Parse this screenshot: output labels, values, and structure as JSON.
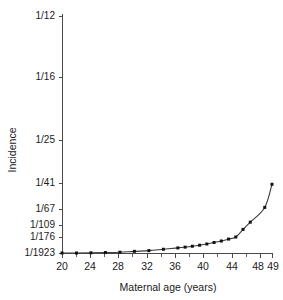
{
  "chart_data": {
    "type": "line",
    "title": "",
    "xlabel": "Maternal age (years)",
    "ylabel": "Incidence",
    "grid": false,
    "legend": null,
    "xlim": [
      20,
      49
    ],
    "x_tick_labels": [
      "20",
      "24",
      "28",
      "32",
      "36",
      "40",
      "44",
      "48",
      "49"
    ],
    "x_ticks": [
      20,
      24,
      28,
      32,
      36,
      40,
      44,
      48,
      49
    ],
    "x_minor_ticks": [
      22,
      26,
      30,
      34,
      38,
      42,
      46
    ],
    "y_tick_labels": [
      "1/12",
      "1/16",
      "1/25",
      "1/41",
      "1/67",
      "1/109",
      "1/176",
      "1/1923"
    ],
    "y_tick_values": [
      12,
      16,
      25,
      41,
      67,
      109,
      176,
      1923
    ],
    "y_axis_note": "Incidence expressed as 1 in N; axis is non-linear (reciprocal/log spaced)",
    "series": [
      {
        "name": "Incidence of Down syndrome",
        "x": [
          20,
          22,
          24,
          26,
          28,
          30,
          32,
          34,
          36,
          37,
          38,
          39,
          40,
          41,
          42,
          43,
          44,
          45,
          46,
          48,
          49
        ],
        "y_denominators": [
          1923,
          1923,
          1870,
          1800,
          1700,
          1500,
          1350,
          1100,
          900,
          800,
          700,
          600,
          500,
          400,
          320,
          240,
          176,
          130,
          100,
          65,
          42
        ],
        "y_labels": [
          "1/1923",
          "1/1923",
          "1/1870",
          "1/1800",
          "1/1700",
          "1/1500",
          "1/1350",
          "1/1100",
          "1/900",
          "1/800",
          "1/700",
          "1/600",
          "1/500",
          "1/400",
          "1/320",
          "1/240",
          "1/176",
          "1/130",
          "1/100",
          "1/65",
          "1/42"
        ]
      }
    ]
  },
  "axes": {
    "y_title": "Incidence",
    "x_title": "Maternal age (years)"
  }
}
